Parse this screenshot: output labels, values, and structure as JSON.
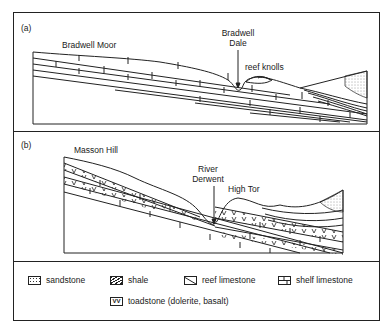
{
  "panels": [
    {
      "id": "a",
      "tag": "(a)",
      "labels": {
        "moor": "Bradwell Moor",
        "dale_line1": "Bradwell",
        "dale_line2": "Dale",
        "knolls": "reef knolls"
      }
    },
    {
      "id": "b",
      "tag": "(b)",
      "labels": {
        "hill": "Masson Hill",
        "river_line1": "River",
        "river_line2": "Derwent",
        "tor": "High Tor"
      }
    }
  ],
  "legend": {
    "items": [
      {
        "key": "sandstone",
        "label": "sandstone",
        "icon": "sandstone-dots-icon"
      },
      {
        "key": "shale",
        "label": "shale",
        "icon": "shale-hatch-icon"
      },
      {
        "key": "reef",
        "label": "reef limestone",
        "icon": "reef-limestone-icon"
      },
      {
        "key": "shelf",
        "label": "shelf limestone",
        "icon": "shelf-limestone-brick-icon"
      },
      {
        "key": "toadstone",
        "label": "toadstone (dolerite, basalt)",
        "icon": "toadstone-vv-icon",
        "glyph": "VV"
      }
    ]
  },
  "colors": {
    "line": "#222222",
    "background": "#ffffff"
  }
}
